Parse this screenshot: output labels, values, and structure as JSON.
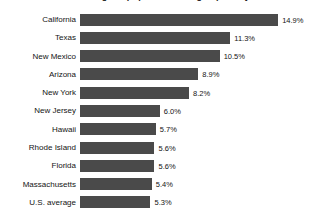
{
  "chart_data": {
    "type": "bar",
    "orientation": "horizontal",
    "title": "Percentage of population living in poverty",
    "xlabel": "",
    "ylabel": "",
    "grid": false,
    "legend": false,
    "value_suffix": "%",
    "xlim": [
      0,
      14.9
    ],
    "bar_color": "#4a4a4a",
    "background_color": "#ffffff",
    "text_color": "#141414",
    "categories": [
      "California",
      "Texas",
      "New Mexico",
      "Arizona",
      "New York",
      "New Jersey",
      "Hawaii",
      "Rhode Island",
      "Florida",
      "Massachusetts",
      "U.S. average"
    ],
    "values": [
      14.9,
      11.3,
      10.5,
      8.9,
      8.2,
      6.0,
      5.7,
      5.6,
      5.6,
      5.4,
      5.3
    ],
    "value_labels": [
      "14.9%",
      "11.3%",
      "10.5%",
      "8.9%",
      "8.2%",
      "6.0%",
      "5.7%",
      "5.6%",
      "5.6%",
      "5.4%",
      "5.3%"
    ]
  }
}
